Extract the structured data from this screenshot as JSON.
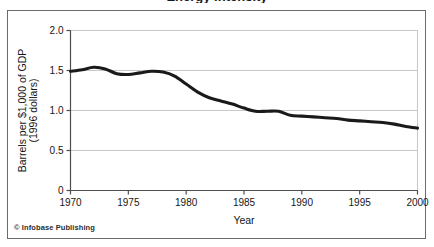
{
  "figure": {
    "title_fragment": "Energy Intensity",
    "credit": "© Infobase Publishing"
  },
  "colors": {
    "line": "#1a1a1a",
    "grid": "#c8c8c8",
    "axis": "#4d4d4d",
    "frame": "#6b6b6b",
    "background": "#ffffff",
    "text": "#151515"
  },
  "axis": {
    "y_label_line1": "Barrels per $1,000 of GDP",
    "y_label_line2": "(1996 dollars)",
    "x_label": "Year",
    "y_ticks": [
      "0",
      "0.5",
      "1.0",
      "1.5",
      "2.0"
    ],
    "x_ticks": [
      "1970",
      "1975",
      "1980",
      "1985",
      "1990",
      "1995",
      "2000"
    ]
  },
  "chart_data": {
    "type": "line",
    "title": "Energy Intensity",
    "xlabel": "Year",
    "ylabel": "Barrels per $1,000 of GDP (1996 dollars)",
    "xlim": [
      1970,
      2000
    ],
    "ylim": [
      0,
      2.0
    ],
    "xticks": [
      1970,
      1975,
      1980,
      1985,
      1990,
      1995,
      2000
    ],
    "yticks": [
      0,
      0.5,
      1.0,
      1.5,
      2.0
    ],
    "grid": "horizontal",
    "legend": "none",
    "series": [
      {
        "name": "Energy intensity",
        "x": [
          1970,
          1971,
          1972,
          1973,
          1974,
          1975,
          1976,
          1977,
          1978,
          1979,
          1980,
          1981,
          1982,
          1983,
          1984,
          1985,
          1986,
          1987,
          1988,
          1989,
          1990,
          1991,
          1992,
          1993,
          1994,
          1995,
          1996,
          1997,
          1998,
          1999,
          2000
        ],
        "values": [
          1.49,
          1.51,
          1.54,
          1.52,
          1.46,
          1.45,
          1.47,
          1.49,
          1.48,
          1.43,
          1.33,
          1.23,
          1.16,
          1.12,
          1.08,
          1.03,
          0.99,
          0.99,
          0.99,
          0.94,
          0.93,
          0.92,
          0.91,
          0.9,
          0.88,
          0.87,
          0.86,
          0.85,
          0.83,
          0.8,
          0.78
        ]
      }
    ]
  }
}
